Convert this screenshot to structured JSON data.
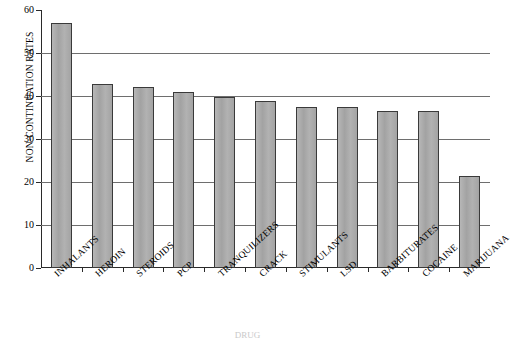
{
  "chart_data": {
    "type": "bar",
    "title": "",
    "xlabel": "DRUG",
    "ylabel": "NON-CONTINUATION RATES",
    "ylim": [
      0,
      60
    ],
    "yticks": [
      0,
      10,
      20,
      30,
      40,
      50,
      60
    ],
    "grid": true,
    "legend": "none",
    "bar_color": "#a9a9a9",
    "bar_border_color": "#3a3a3a",
    "categories": [
      "INHALANTS",
      "HEROIN",
      "STEROIDS",
      "PCP",
      "TRANQUILIZERS",
      "CRACK",
      "STIMULANTS",
      "LSD",
      "BARBITURATES",
      "COCAINE",
      "MARIJUANA"
    ],
    "values": [
      57.0,
      42.8,
      42.0,
      41.0,
      39.8,
      38.8,
      37.5,
      37.5,
      36.5,
      36.4,
      21.3
    ]
  }
}
